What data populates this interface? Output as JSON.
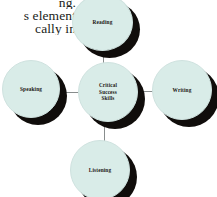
{
  "page": {
    "background_color": "#ffffff",
    "width": 217,
    "height": 197
  },
  "document_text": {
    "line1": "ng.",
    "line2": "s element",
    "line3": "cally in"
  },
  "diagram": {
    "type": "hub-and-spoke",
    "node_fill_color": "#d9ece8",
    "node_border_color": "#cfe2df",
    "shadow_color": "#100d0b",
    "connector_color": "#888d8d",
    "center": {
      "label": "Critical Success Skills",
      "line1": "Critical",
      "line2": "Success",
      "line3": "Skills"
    },
    "spokes": [
      {
        "id": "reading",
        "label": "Reading",
        "position": "top"
      },
      {
        "id": "writing",
        "label": "Writing",
        "position": "right"
      },
      {
        "id": "listening",
        "label": "Listening",
        "position": "bottom"
      },
      {
        "id": "speaking",
        "label": "Speaking",
        "position": "left"
      }
    ]
  }
}
